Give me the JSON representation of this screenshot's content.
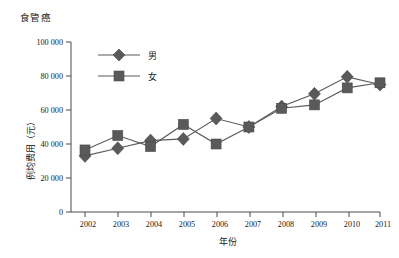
{
  "chart_data": {
    "type": "line",
    "title": "食管癌",
    "xlabel": "年份",
    "ylabel": "例均费用（元）",
    "categories": [
      "2002",
      "2003",
      "2004",
      "2005",
      "2006",
      "2007",
      "2008",
      "2009",
      "2010",
      "2011"
    ],
    "series": [
      {
        "name": "男",
        "marker": "diamond",
        "color": "#5a5a5a",
        "values": [
          33000,
          37500,
          42000,
          43000,
          55000,
          50000,
          62000,
          69500,
          79500,
          75000
        ]
      },
      {
        "name": "女",
        "marker": "square",
        "color": "#5a5a5a",
        "values": [
          36500,
          45000,
          38500,
          51500,
          40000,
          50000,
          61000,
          63000,
          73000,
          76000
        ]
      }
    ],
    "ylim": [
      0,
      100000
    ],
    "yticks": [
      0,
      20000,
      40000,
      60000,
      80000,
      100000
    ],
    "ytick_labels": [
      "0",
      "20 000",
      "40 000",
      "60 000",
      "80 000",
      "100 000"
    ],
    "grid": false,
    "legend_position": "top-left-inside",
    "legend_entries": [
      "男",
      "女"
    ]
  }
}
